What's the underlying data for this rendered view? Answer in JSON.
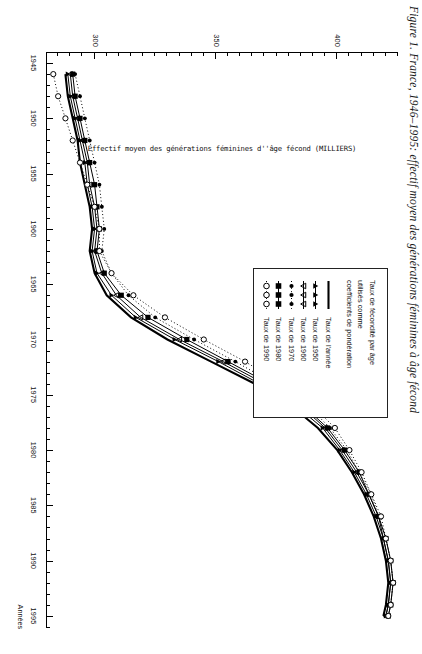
{
  "figure": {
    "caption": "Figure 1. France, 1946–1995: effectif moyen des générations féminines à âge fécond"
  },
  "axes": {
    "x_title": "Années",
    "y_title": "Effectif moyen des générations féminines d''âge fécond (MILLIERS)",
    "x_ticks": [
      "1945",
      "1950",
      "1955",
      "1960",
      "1965",
      "1970",
      "1975",
      "1980",
      "1985",
      "1990",
      "1995"
    ],
    "y_ticks": [
      "300",
      "350",
      "400"
    ],
    "x_range": [
      1944,
      1996
    ],
    "y_range": [
      280,
      425
    ]
  },
  "legend": {
    "header": "Taux de fécondité par âge utilisés comme coefficients de pondération",
    "header_lines": [
      "Taux de fécondité par âge",
      "utilisés comme",
      "coefficients de pondération"
    ],
    "items": [
      {
        "label": "Taux de l'année",
        "marker": "none",
        "line": "solid"
      },
      {
        "label": "Taux de 1950",
        "marker": "triangle-up",
        "line": "solid"
      },
      {
        "label": "Taux de 1960",
        "marker": "triangle-down",
        "line": "solid"
      },
      {
        "label": "Taux de 1970",
        "marker": "dot-small",
        "line": "dotted"
      },
      {
        "label": "Taux de 1980",
        "marker": "square",
        "line": "solid"
      },
      {
        "label": "Taux de 1990",
        "marker": "circle-open",
        "line": "dotted"
      }
    ]
  },
  "chart_data": {
    "type": "line",
    "title": "Figure 1. France, 1946–1995: effectif moyen des générations féminines à âge fécond",
    "xlabel": "Années",
    "ylabel": "Effectif moyen des générations féminines d''âge fécond (MILLIERS)",
    "xlim": [
      1944,
      1996
    ],
    "ylim": [
      280,
      425
    ],
    "grid": false,
    "legend_position": "upper-right-inset",
    "x": [
      1946,
      1948,
      1950,
      1952,
      1954,
      1956,
      1958,
      1960,
      1962,
      1964,
      1966,
      1968,
      1970,
      1972,
      1974,
      1976,
      1978,
      1980,
      1982,
      1984,
      1986,
      1988,
      1990,
      1992,
      1994,
      1995
    ],
    "series": [
      {
        "name": "Taux de l'année",
        "values": [
          288,
          289,
          291,
          293,
          294,
          296,
          298,
          299,
          298,
          300,
          305,
          315,
          330,
          348,
          366,
          381,
          392,
          400,
          406,
          411,
          415,
          418,
          420,
          421,
          420,
          419
        ]
      },
      {
        "name": "Taux de 1950",
        "values": [
          289,
          290,
          292,
          294,
          296,
          297,
          299,
          300,
          299,
          301,
          307,
          317,
          333,
          351,
          368,
          383,
          394,
          401,
          407,
          412,
          416,
          419,
          421,
          422,
          421,
          420
        ]
      },
      {
        "name": "Taux de 1960",
        "values": [
          290,
          291,
          293,
          295,
          297,
          298,
          300,
          301,
          300,
          303,
          309,
          319,
          335,
          353,
          370,
          385,
          395,
          402,
          408,
          413,
          417,
          419,
          421,
          422,
          421,
          420
        ]
      },
      {
        "name": "Taux de 1970",
        "values": [
          292,
          294,
          296,
          298,
          300,
          302,
          303,
          304,
          303,
          307,
          314,
          325,
          341,
          358,
          374,
          388,
          397,
          404,
          409,
          414,
          417,
          420,
          422,
          423,
          422,
          421
        ]
      },
      {
        "name": "Taux de 1980",
        "values": [
          291,
          292,
          294,
          296,
          298,
          300,
          301,
          302,
          301,
          304,
          311,
          322,
          338,
          355,
          372,
          386,
          396,
          403,
          409,
          413,
          417,
          420,
          422,
          423,
          422,
          421
        ]
      },
      {
        "name": "Taux de 1990",
        "values": [
          283,
          285,
          288,
          291,
          294,
          297,
          300,
          302,
          302,
          307,
          316,
          329,
          345,
          362,
          377,
          390,
          399,
          405,
          410,
          414,
          418,
          420,
          422,
          423,
          422,
          421
        ]
      }
    ]
  }
}
